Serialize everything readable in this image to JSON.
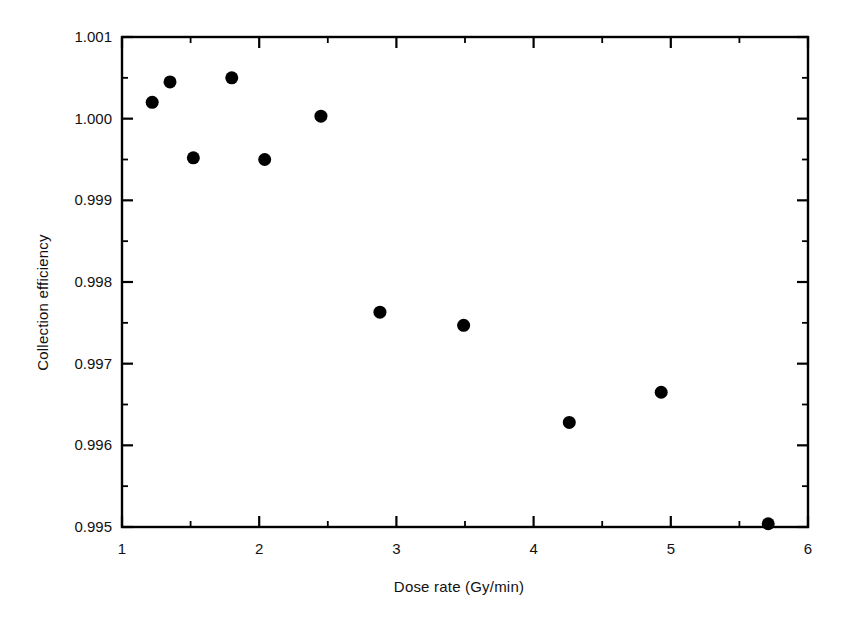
{
  "chart_data": {
    "type": "scatter",
    "title": "",
    "xlabel": "Dose rate (Gy/min)",
    "ylabel": "Collection efficiency",
    "xlim": [
      1,
      6
    ],
    "ylim": [
      0.995,
      1.001
    ],
    "xticks": [
      "1",
      "2",
      "3",
      "4",
      "5",
      "6"
    ],
    "xtick_values": [
      1,
      2,
      3,
      4,
      5,
      6
    ],
    "x_minor_step": 0.5,
    "yticks": [
      "0.995",
      "0.996",
      "0.997",
      "0.998",
      "0.999",
      "1.000",
      "1.001"
    ],
    "ytick_values": [
      0.995,
      0.996,
      0.997,
      0.998,
      0.999,
      1.0,
      1.001
    ],
    "y_minor_step": 0.0005,
    "grid": false,
    "legend": null,
    "marker": "filled-circle",
    "marker_color": "#000000",
    "marker_size_px": 13,
    "series": [
      {
        "name": "Collection efficiency vs dose rate",
        "points": [
          {
            "x": 1.22,
            "y": 1.0002
          },
          {
            "x": 1.35,
            "y": 1.00045
          },
          {
            "x": 1.52,
            "y": 0.99952
          },
          {
            "x": 1.8,
            "y": 1.0005
          },
          {
            "x": 2.04,
            "y": 0.9995
          },
          {
            "x": 2.45,
            "y": 1.00003
          },
          {
            "x": 2.88,
            "y": 0.99763
          },
          {
            "x": 3.49,
            "y": 0.99747
          },
          {
            "x": 4.26,
            "y": 0.99628
          },
          {
            "x": 4.93,
            "y": 0.99665
          },
          {
            "x": 5.71,
            "y": 0.99504
          }
        ]
      }
    ]
  },
  "axes": {
    "frame_color": "#000000",
    "background": "#ffffff"
  }
}
